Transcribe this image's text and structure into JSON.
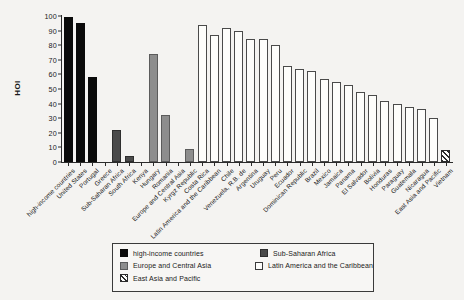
{
  "chart_data": {
    "type": "bar",
    "title": "",
    "xlabel": "",
    "ylabel": "HOI",
    "ylim": [
      0,
      100
    ],
    "ytick_values": [
      0,
      10,
      20,
      30,
      40,
      50,
      60,
      70,
      80,
      90,
      100
    ],
    "ytick_labels": [
      "0",
      "10",
      "20",
      "30",
      "40",
      "50",
      "60",
      "70",
      "80",
      "90",
      "100"
    ],
    "grid": false,
    "legend_position": "below-axis-center",
    "categories": [
      "high-income countries",
      "United States",
      "Portugal",
      "Greece",
      "Sub-Saharan Africa",
      "South Africa",
      "Kenya",
      "Hungary",
      "Romania",
      "Europe and Central Asia",
      "Kyrgz Republic",
      "Costa Rica",
      "Latin America and the Caribbean",
      "Chile",
      "Venezuela, R.B. de",
      "Argentina",
      "Uruguay",
      "Peru",
      "Ecuador",
      "Dominican Republic",
      "Brazil",
      "Mexico",
      "Jamaica",
      "Panama",
      "El Salvador",
      "Bolivia",
      "Honduras",
      "Paraguay",
      "Guatemala",
      "Nicaragua",
      "East Asia and Pacific",
      "Vietnam"
    ],
    "values": [
      99,
      95,
      58.5,
      0,
      22,
      4,
      74,
      32,
      0,
      9,
      94,
      87,
      92,
      90,
      84,
      80,
      80,
      66,
      64,
      62,
      57,
      55,
      53,
      48,
      46,
      42,
      40,
      38,
      36,
      30,
      22,
      8
    ],
    "series": [
      {
        "name": "high-income countries",
        "color_key": "c-hic",
        "points": [
          {
            "category": "high-income countries",
            "value": 99
          },
          {
            "category": "United States",
            "value": 95
          },
          {
            "category": "Portugal",
            "value": 58.5
          }
        ]
      },
      {
        "name": "Sub-Saharan Africa",
        "color_key": "c-ssa",
        "points": [
          {
            "category": "Greece",
            "value": 22
          },
          {
            "category": "Sub-Saharan Africa",
            "value": 4
          }
        ]
      },
      {
        "name": "Europe and Central Asia",
        "color_key": "c-eca",
        "points": [
          {
            "category": "South Africa",
            "value": 74
          },
          {
            "category": "Kenya",
            "value": 32
          }
        ]
      },
      {
        "name": "Latin America and the Caribbean",
        "color_key": "c-lac",
        "points": [
          {
            "category": "Costa Rica",
            "value": 94
          }
        ]
      },
      {
        "name": "East Asia and Pacific",
        "color_key": "c-eap",
        "points": [
          {
            "category": "Vietnam",
            "value": 8
          }
        ]
      }
    ],
    "bars": [
      {
        "label": "high-income countries",
        "value": 99,
        "group": "c-hic"
      },
      {
        "label": "United States",
        "value": 95,
        "group": "c-hic"
      },
      {
        "label": "Portugal",
        "value": 58.5,
        "group": "c-hic"
      },
      {
        "label": "Greece",
        "value": 0,
        "group": "c-hic"
      },
      {
        "label": "Sub-Saharan Africa",
        "value": 22,
        "group": "c-ssa"
      },
      {
        "label": "South Africa",
        "value": 4,
        "group": "c-ssa"
      },
      {
        "label": "Kenya",
        "value": 0,
        "group": "c-ssa"
      },
      {
        "label": "Hungary",
        "value": 74,
        "group": "c-eca"
      },
      {
        "label": "Romania",
        "value": 32,
        "group": "c-eca"
      },
      {
        "label": "Europe and Central Asia",
        "value": 0,
        "group": "c-eca"
      },
      {
        "label": "Kyrgz Republic",
        "value": 9,
        "group": "c-eca"
      },
      {
        "label": "Costa Rica",
        "value": 94,
        "group": "c-lac"
      },
      {
        "label": "Latin America and the Caribbean",
        "value": 87,
        "group": "c-lac"
      },
      {
        "label": "Chile",
        "value": 92,
        "group": "c-lac"
      },
      {
        "label": "Venezuela, R.B. de",
        "value": 90,
        "group": "c-lac"
      },
      {
        "label": "Argentina",
        "value": 84,
        "group": "c-lac"
      },
      {
        "label": "Uruguay",
        "value": 84,
        "group": "c-lac"
      },
      {
        "label": "Peru",
        "value": 80,
        "group": "c-lac"
      },
      {
        "label": "Ecuador",
        "value": 66,
        "group": "c-lac"
      },
      {
        "label": "Dominican Republic",
        "value": 64,
        "group": "c-lac"
      },
      {
        "label": "Brazil",
        "value": 62,
        "group": "c-lac"
      },
      {
        "label": "Mexico",
        "value": 57,
        "group": "c-lac"
      },
      {
        "label": "Jamaica",
        "value": 55,
        "group": "c-lac"
      },
      {
        "label": "Panama",
        "value": 53,
        "group": "c-lac"
      },
      {
        "label": "El Salvador",
        "value": 48,
        "group": "c-lac"
      },
      {
        "label": "Bolivia",
        "value": 46,
        "group": "c-lac"
      },
      {
        "label": "Honduras",
        "value": 42,
        "group": "c-lac"
      },
      {
        "label": "Paraguay",
        "value": 40,
        "group": "c-lac"
      },
      {
        "label": "Guatemala",
        "value": 38,
        "group": "c-lac"
      },
      {
        "label": "Nicaragua",
        "value": 36,
        "group": "c-lac"
      },
      {
        "label": "East Asia and Pacific",
        "value": 30,
        "group": "c-lac"
      },
      {
        "label": "Vietnam",
        "value": 8,
        "group": "c-eap"
      }
    ]
  },
  "legend": {
    "entries": [
      {
        "label": "high-income countries",
        "group": "c-hic"
      },
      {
        "label": "Sub-Saharan Africa",
        "group": "c-ssa"
      },
      {
        "label": "Europe and Central Asia",
        "group": "c-eca"
      },
      {
        "label": "Latin America and the Caribbean",
        "group": "c-lac"
      },
      {
        "label": "East Asia and Pacific",
        "group": "c-eap"
      }
    ]
  },
  "colors": {
    "high_income": "#0a0a0a",
    "sub_saharan_africa": "#4a4a4a",
    "europe_central_asia": "#8d8d8d",
    "latin_america_caribbean": "#fdfdfb",
    "east_asia_pacific_hatch": "#2b2b2b",
    "axis": "#2b2b2b",
    "background": "#f4f3f1"
  }
}
